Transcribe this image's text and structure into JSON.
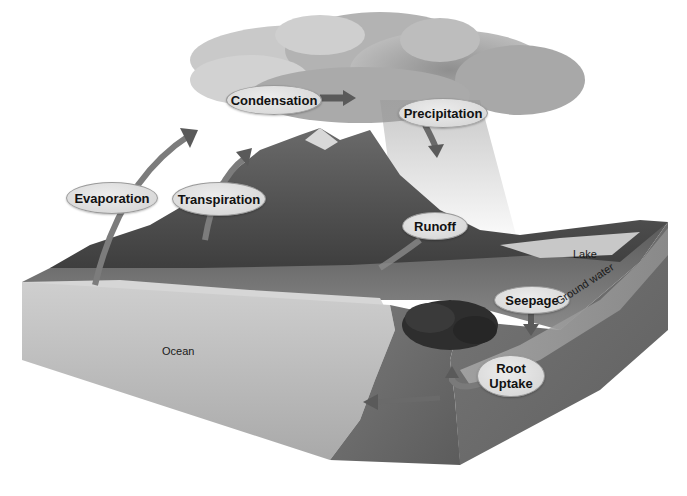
{
  "diagram": {
    "process_labels": {
      "condensation": "Condensation",
      "precipitation": "Precipitation",
      "evaporation": "Evaporation",
      "transpiration": "Transpiration",
      "runoff": "Runoff",
      "seepage": "Seepage",
      "root_uptake_line1": "Root",
      "root_uptake_line2": "Uptake"
    },
    "place_labels": {
      "ocean": "Ocean",
      "lake": "Lake",
      "ground_water": "Ground water"
    },
    "colors": {
      "background": "#ffffff",
      "label_fill": "#dedede",
      "label_border": "#9a9a9a",
      "arrow": "#5a5a5a",
      "cloud": "#9c9c9c",
      "mountain": "#5e5e5e",
      "ocean_face": "#b5b5b5",
      "ground_face": "#6e6e6e"
    }
  }
}
